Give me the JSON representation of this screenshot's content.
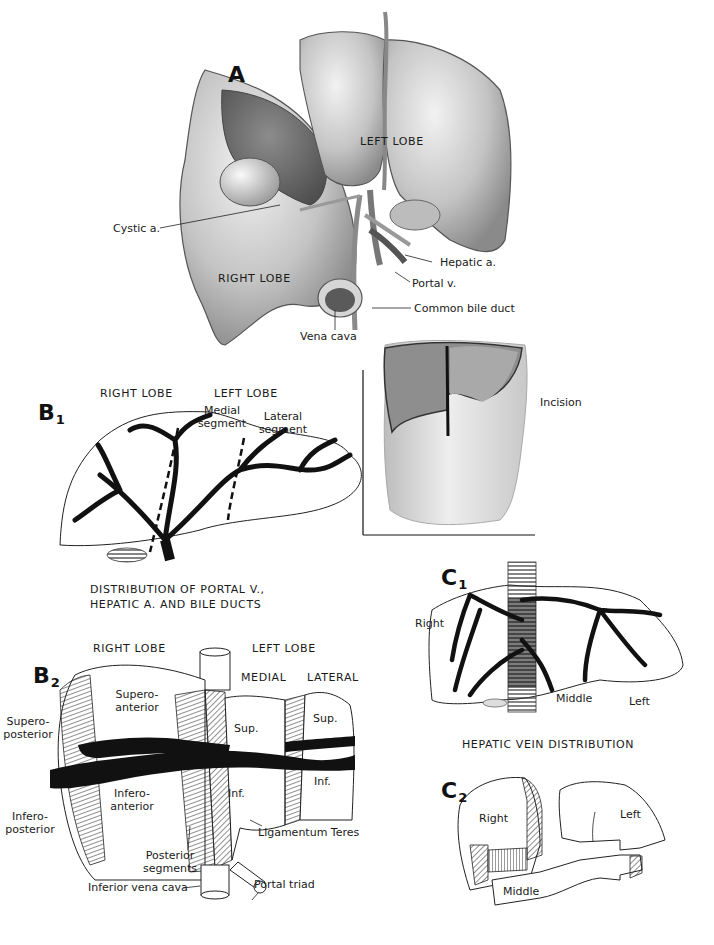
{
  "figure": {
    "panels": {
      "A": {
        "letter": "A",
        "labels": {
          "left_lobe": "LEFT LOBE",
          "right_lobe": "RIGHT LOBE",
          "cystic_a": "Cystic a.",
          "hepatic_a": "Hepatic a.",
          "portal_v": "Portal v.",
          "common_bile_duct": "Common bile duct",
          "vena_cava": "Vena cava"
        }
      },
      "incision": {
        "label": "Incision"
      },
      "B1": {
        "letter": "B",
        "sub": "1",
        "labels": {
          "right_lobe": "RIGHT LOBE",
          "left_lobe": "LEFT LOBE",
          "medial_segment_1": "Medial",
          "medial_segment_2": "segment",
          "lateral_segment_1": "Lateral",
          "lateral_segment_2": "segment"
        },
        "caption_1": "DISTRIBUTION OF PORTAL V.,",
        "caption_2": "HEPATIC A. AND BILE DUCTS"
      },
      "B2": {
        "letter": "B",
        "sub": "2",
        "labels": {
          "right_lobe": "RIGHT LOBE",
          "left_lobe": "LEFT LOBE",
          "medial": "MEDIAL",
          "lateral": "LATERAL",
          "supero_anterior_1": "Supero-",
          "supero_anterior_2": "anterior",
          "supero_posterior_1": "Supero-",
          "supero_posterior_2": "posterior",
          "infero_anterior_1": "Infero-",
          "infero_anterior_2": "anterior",
          "infero_posterior_1": "Infero-",
          "infero_posterior_2": "posterior",
          "medial_sup": "Sup.",
          "medial_inf": "Inf.",
          "lateral_sup": "Sup.",
          "lateral_inf": "Inf.",
          "ligamentum_teres": "Ligamentum Teres",
          "posterior_segments_1": "Posterior",
          "posterior_segments_2": "segments",
          "inferior_vena_cava": "Inferior vena cava",
          "portal_triad": "Portal triad"
        }
      },
      "C1": {
        "letter": "C",
        "sub": "1",
        "labels": {
          "right": "Right",
          "middle": "Middle",
          "left": "Left"
        },
        "caption": "HEPATIC VEIN DISTRIBUTION"
      },
      "C2": {
        "letter": "C",
        "sub": "2",
        "labels": {
          "right": "Right",
          "left": "Left",
          "middle": "Middle"
        }
      }
    },
    "colors": {
      "ink": "#111111",
      "tissue_light": "#d8d8d8",
      "tissue_mid": "#a8a8a8",
      "tissue_dark": "#6a6a6a",
      "background": "#ffffff"
    }
  }
}
